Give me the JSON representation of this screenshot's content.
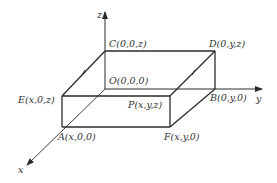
{
  "diagram": {
    "type": "3d-coordinate-box",
    "axes": {
      "x_label": "x",
      "y_label": "y",
      "z_label": "z"
    },
    "points": {
      "C": "C(0,0,z)",
      "D": "D(0,y,z)",
      "O": "O(0,0,0)",
      "E": "E(x,0,z)",
      "P": "P(x,y,z)",
      "B": "B(0,y,0)",
      "A": "A(x,0,0)",
      "F": "F(x,y,0)"
    },
    "colors": {
      "line": "#2a2a2a",
      "text": "#333333",
      "background": "#ffffff"
    }
  }
}
